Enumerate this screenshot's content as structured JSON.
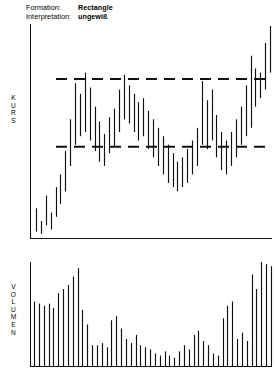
{
  "caption": {
    "rows": [
      {
        "key": "Formation:",
        "value": "Rectangle"
      },
      {
        "key": "Interpretation:",
        "value": "ungewiß"
      }
    ]
  },
  "axes": {
    "price_label": "KURS",
    "volume_label": "VOLUMEN"
  },
  "chart_data": {
    "type": "bar",
    "title": "Rectangle",
    "subtitle": "ungewiß",
    "xlabel": "",
    "ylabel": "KURS",
    "grid": false,
    "legend": null,
    "panels": [
      {
        "name": "price",
        "ylabel": "KURS",
        "type": "ohlc-range-bars",
        "note": "Vertical high-low bars; rising lead-in, then sideways Rectangle consolidation between horizontal resistance and support, then upside breakout.",
        "ylim": [
          0,
          100
        ],
        "bars": [
          {
            "i": 0,
            "low": 3,
            "high": 14
          },
          {
            "i": 1,
            "low": 2,
            "high": 8
          },
          {
            "i": 2,
            "low": 6,
            "high": 20
          },
          {
            "i": 3,
            "low": 4,
            "high": 12
          },
          {
            "i": 4,
            "low": 10,
            "high": 24
          },
          {
            "i": 5,
            "low": 16,
            "high": 30
          },
          {
            "i": 6,
            "low": 22,
            "high": 41
          },
          {
            "i": 7,
            "low": 34,
            "high": 56
          },
          {
            "i": 8,
            "low": 44,
            "high": 73
          },
          {
            "i": 9,
            "low": 48,
            "high": 68
          },
          {
            "i": 10,
            "low": 50,
            "high": 78
          },
          {
            "i": 11,
            "low": 46,
            "high": 71
          },
          {
            "i": 12,
            "low": 41,
            "high": 62
          },
          {
            "i": 13,
            "low": 36,
            "high": 55
          },
          {
            "i": 14,
            "low": 34,
            "high": 49
          },
          {
            "i": 15,
            "low": 40,
            "high": 57
          },
          {
            "i": 16,
            "low": 43,
            "high": 61
          },
          {
            "i": 17,
            "low": 50,
            "high": 70
          },
          {
            "i": 18,
            "low": 56,
            "high": 77
          },
          {
            "i": 19,
            "low": 54,
            "high": 72
          },
          {
            "i": 20,
            "low": 50,
            "high": 68
          },
          {
            "i": 21,
            "low": 46,
            "high": 64
          },
          {
            "i": 22,
            "low": 48,
            "high": 66
          },
          {
            "i": 23,
            "low": 42,
            "high": 60
          },
          {
            "i": 24,
            "low": 38,
            "high": 56
          },
          {
            "i": 25,
            "low": 34,
            "high": 52
          },
          {
            "i": 26,
            "low": 30,
            "high": 48
          },
          {
            "i": 27,
            "low": 26,
            "high": 44
          },
          {
            "i": 28,
            "low": 24,
            "high": 40
          },
          {
            "i": 29,
            "low": 22,
            "high": 36
          },
          {
            "i": 30,
            "low": 24,
            "high": 38
          },
          {
            "i": 31,
            "low": 26,
            "high": 42
          },
          {
            "i": 32,
            "low": 30,
            "high": 46
          },
          {
            "i": 33,
            "low": 34,
            "high": 52
          },
          {
            "i": 34,
            "low": 44,
            "high": 74
          },
          {
            "i": 35,
            "low": 42,
            "high": 65
          },
          {
            "i": 36,
            "low": 46,
            "high": 70
          },
          {
            "i": 37,
            "low": 38,
            "high": 58
          },
          {
            "i": 38,
            "low": 32,
            "high": 50
          },
          {
            "i": 39,
            "low": 30,
            "high": 46
          },
          {
            "i": 40,
            "low": 34,
            "high": 50
          },
          {
            "i": 41,
            "low": 38,
            "high": 56
          },
          {
            "i": 42,
            "low": 44,
            "high": 62
          },
          {
            "i": 43,
            "low": 48,
            "high": 72
          },
          {
            "i": 44,
            "low": 52,
            "high": 86
          },
          {
            "i": 45,
            "low": 62,
            "high": 80
          },
          {
            "i": 46,
            "low": 66,
            "high": 78
          },
          {
            "i": 47,
            "low": 70,
            "high": 92
          },
          {
            "i": 48,
            "low": 78,
            "high": 100
          }
        ],
        "lines": [
          {
            "name": "resistance",
            "label": "resistance",
            "style": "dashed",
            "value": 75
          },
          {
            "name": "support",
            "label": "support",
            "style": "dashed",
            "value": 43
          }
        ]
      },
      {
        "name": "volume",
        "ylabel": "VOLUMEN",
        "type": "bar",
        "note": "Volume histogram forms a U-shape: heavy at the start, drying up through the Rectangle, surging on the breakout.",
        "ylim": [
          0,
          100
        ],
        "values": [
          62,
          60,
          58,
          60,
          56,
          70,
          74,
          78,
          86,
          94,
          54,
          40,
          20,
          20,
          22,
          18,
          44,
          48,
          36,
          26,
          22,
          30,
          20,
          18,
          16,
          12,
          10,
          14,
          10,
          8,
          14,
          20,
          16,
          30,
          34,
          24,
          20,
          12,
          10,
          46,
          58,
          62,
          26,
          32,
          24,
          88,
          74,
          100,
          98,
          96
        ]
      }
    ]
  }
}
